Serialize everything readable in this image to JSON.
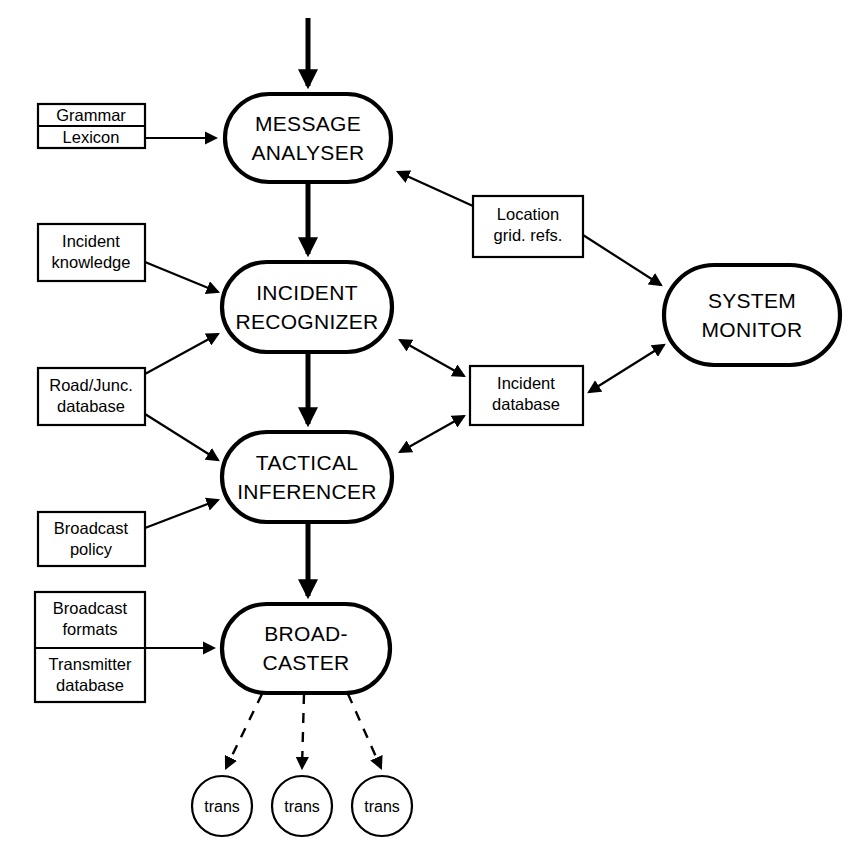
{
  "diagram": {
    "background_color": "#ffffff",
    "line_color": "#000000",
    "width": 863,
    "height": 866
  },
  "processes": [
    {
      "id": "message-analyser",
      "line1": "MESSAGE",
      "line2": "ANALYSER",
      "x": 225,
      "y": 94,
      "w": 166,
      "h": 88
    },
    {
      "id": "incident-recognizer",
      "line1": "INCIDENT",
      "line2": "RECOGNIZER",
      "x": 222,
      "y": 262,
      "w": 170,
      "h": 90
    },
    {
      "id": "tactical-inferencer",
      "line1": "TACTICAL",
      "line2": "INFERENCER",
      "x": 222,
      "y": 432,
      "w": 170,
      "h": 90
    },
    {
      "id": "broadcaster",
      "line1": "BROAD-",
      "line2": "CASTER",
      "x": 222,
      "y": 604,
      "w": 168,
      "h": 89
    },
    {
      "id": "system-monitor",
      "line1": "SYSTEM",
      "line2": "MONITOR",
      "x": 664,
      "y": 265,
      "w": 176,
      "h": 100
    }
  ],
  "stores": [
    {
      "id": "grammar-lexicon",
      "x": 38,
      "y": 104,
      "w": 107,
      "h": 44,
      "rows": [
        "Grammar",
        "Lexicon"
      ]
    },
    {
      "id": "incident-knowledge",
      "x": 38,
      "y": 224,
      "w": 107,
      "h": 57,
      "rows": [
        "Incident knowledge"
      ],
      "lines": [
        "Incident",
        "knowledge"
      ]
    },
    {
      "id": "road-junction-database",
      "x": 38,
      "y": 368,
      "w": 107,
      "h": 57,
      "rows": [
        "Road/Junc. database"
      ],
      "lines": [
        "Road/Junc.",
        "database"
      ]
    },
    {
      "id": "broadcast-policy",
      "x": 38,
      "y": 512,
      "w": 107,
      "h": 54,
      "rows": [
        "Broadcast policy"
      ],
      "lines": [
        "Broadcast",
        "policy"
      ]
    },
    {
      "id": "broadcast-transmitter-store",
      "x": 35,
      "y": 592,
      "w": 110,
      "h": 110,
      "rows": [
        "Broadcast formats",
        "Transmitter database"
      ],
      "top_lines": [
        "Broadcast",
        "formats"
      ],
      "bottom_lines": [
        "Transmitter",
        "database"
      ]
    },
    {
      "id": "location-grid-refs",
      "x": 473,
      "y": 196,
      "w": 110,
      "h": 61,
      "rows": [
        "Location grid. refs."
      ],
      "lines": [
        "Location",
        "grid. refs."
      ]
    },
    {
      "id": "incident-database",
      "x": 470,
      "y": 366,
      "w": 113,
      "h": 59,
      "rows": [
        "Incident database"
      ],
      "lines": [
        "Incident",
        "database"
      ]
    }
  ],
  "transmitters": [
    {
      "id": "transmitter-1",
      "label": "trans",
      "cx": 222,
      "cy": 806,
      "r": 30
    },
    {
      "id": "transmitter-2",
      "label": "trans",
      "cx": 302,
      "cy": 806,
      "r": 30
    },
    {
      "id": "transmitter-3",
      "label": "trans",
      "cx": 382,
      "cy": 806,
      "r": 30
    }
  ],
  "flows": [
    {
      "id": "input-to-message-analyser",
      "style": "thick",
      "from": "external-input",
      "to": "message-analyser"
    },
    {
      "id": "grammar-lexicon-to-message-analyser",
      "style": "thin",
      "from": "grammar-lexicon",
      "to": "message-analyser"
    },
    {
      "id": "message-analyser-to-incident-recognizer",
      "style": "thick",
      "from": "message-analyser",
      "to": "incident-recognizer"
    },
    {
      "id": "location-grid-refs-to-message-analyser",
      "style": "thin",
      "from": "location-grid-refs",
      "to": "message-analyser"
    },
    {
      "id": "location-grid-refs-to-system-monitor",
      "style": "thin",
      "from": "location-grid-refs",
      "to": "system-monitor"
    },
    {
      "id": "incident-knowledge-to-incident-recognizer",
      "style": "thin",
      "from": "incident-knowledge",
      "to": "incident-recognizer"
    },
    {
      "id": "road-junction-to-incident-recognizer",
      "style": "thin",
      "from": "road-junction-database",
      "to": "incident-recognizer"
    },
    {
      "id": "road-junction-to-tactical-inferencer",
      "style": "thin",
      "from": "road-junction-database",
      "to": "tactical-inferencer"
    },
    {
      "id": "incident-recognizer-to-incident-database",
      "style": "thin-bidirectional",
      "from": "incident-recognizer",
      "to": "incident-database"
    },
    {
      "id": "incident-recognizer-to-tactical-inferencer",
      "style": "thick",
      "from": "incident-recognizer",
      "to": "tactical-inferencer"
    },
    {
      "id": "tactical-inferencer-to-incident-database",
      "style": "thin-bidirectional",
      "from": "tactical-inferencer",
      "to": "incident-database"
    },
    {
      "id": "incident-database-to-system-monitor",
      "style": "thin-bidirectional",
      "from": "incident-database",
      "to": "system-monitor"
    },
    {
      "id": "broadcast-policy-to-tactical-inferencer",
      "style": "thin",
      "from": "broadcast-policy",
      "to": "tactical-inferencer"
    },
    {
      "id": "tactical-inferencer-to-broadcaster",
      "style": "thick",
      "from": "tactical-inferencer",
      "to": "broadcaster"
    },
    {
      "id": "broadcast-store-to-broadcaster",
      "style": "thin",
      "from": "broadcast-transmitter-store",
      "to": "broadcaster"
    },
    {
      "id": "broadcaster-to-transmitter-1",
      "style": "dashed",
      "from": "broadcaster",
      "to": "transmitter-1"
    },
    {
      "id": "broadcaster-to-transmitter-2",
      "style": "dashed",
      "from": "broadcaster",
      "to": "transmitter-2"
    },
    {
      "id": "broadcaster-to-transmitter-3",
      "style": "dashed",
      "from": "broadcaster",
      "to": "transmitter-3"
    }
  ]
}
